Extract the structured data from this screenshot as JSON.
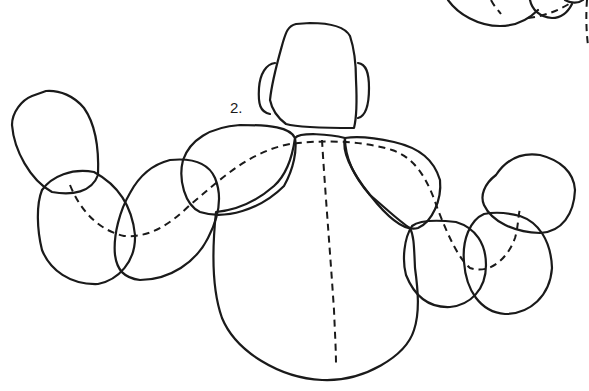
{
  "figure": {
    "label": "2.",
    "colors": {
      "ink": "#1a1a1a",
      "background": "#ffffff"
    },
    "parts": [
      {
        "id": "head",
        "type": "rounded-trapezoid"
      },
      {
        "id": "left-ear",
        "type": "rounded-tab"
      },
      {
        "id": "right-ear",
        "type": "rounded-tab"
      },
      {
        "id": "torso",
        "type": "large-round-body"
      },
      {
        "id": "left-shoulder",
        "type": "ellipse"
      },
      {
        "id": "right-shoulder",
        "type": "teardrop"
      },
      {
        "id": "left-upper-arm",
        "type": "ellipse"
      },
      {
        "id": "left-forearm",
        "type": "ellipse"
      },
      {
        "id": "left-hand",
        "type": "rounded-blob"
      },
      {
        "id": "right-upper-arm",
        "type": "circle"
      },
      {
        "id": "right-forearm",
        "type": "circle"
      },
      {
        "id": "right-hand",
        "type": "rounded-blob"
      },
      {
        "id": "spine-line",
        "type": "dashed"
      },
      {
        "id": "arm-line",
        "type": "dashed"
      },
      {
        "id": "top-right-fragment",
        "type": "partial-figure"
      }
    ]
  }
}
